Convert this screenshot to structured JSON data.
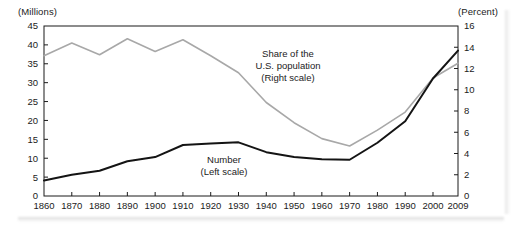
{
  "chart_data": {
    "type": "line",
    "title": "",
    "subtitle": "",
    "xlabel": "",
    "ylabel": "(Millions)",
    "y2label": "(Percent)",
    "left_axis_unit_label": "(Millions)",
    "right_axis_unit_label": "(Percent)",
    "x": [
      1860,
      1870,
      1880,
      1890,
      1900,
      1910,
      1920,
      1930,
      1940,
      1950,
      1960,
      1970,
      1980,
      1990,
      2000,
      2009
    ],
    "xtick_labels": [
      "1860",
      "1870",
      "1880",
      "1890",
      "1900",
      "1910",
      "1920",
      "1930",
      "1940",
      "1950",
      "1960",
      "1970",
      "1980",
      "1990",
      "2000",
      "2009"
    ],
    "xlim": [
      1860,
      2009
    ],
    "ylim": [
      0,
      45
    ],
    "y2lim": [
      0,
      16
    ],
    "ytick_labels": [
      "0",
      "5",
      "10",
      "15",
      "20",
      "25",
      "30",
      "35",
      "40",
      "45"
    ],
    "ytick_values": [
      0,
      5,
      10,
      15,
      20,
      25,
      30,
      35,
      40,
      45
    ],
    "y2tick_labels": [
      "0",
      "2",
      "4",
      "6",
      "8",
      "10",
      "12",
      "14",
      "16"
    ],
    "y2tick_values": [
      0,
      2,
      4,
      6,
      8,
      10,
      12,
      14,
      16
    ],
    "grid": false,
    "legend_position": "inline-annotations",
    "series": [
      {
        "name": "Number (Left scale)",
        "axis": "left",
        "color": "#141414",
        "line_width": 2.0,
        "annotation_line1": "Number",
        "annotation_line2": "(Left scale)",
        "values": [
          4.1,
          5.6,
          6.7,
          9.2,
          10.3,
          13.5,
          13.9,
          14.2,
          11.6,
          10.3,
          9.7,
          9.6,
          14.1,
          19.8,
          31.1,
          38.5
        ]
      },
      {
        "name": "Share of the U.S. population (Right scale)",
        "axis": "right",
        "color": "#a8a8a8",
        "line_width": 1.6,
        "annotation_line1": "Share of the",
        "annotation_line2": "U.S. population",
        "annotation_line3": "(Right scale)",
        "values": [
          13.2,
          14.4,
          13.3,
          14.8,
          13.6,
          14.7,
          13.2,
          11.6,
          8.8,
          6.9,
          5.4,
          4.7,
          6.2,
          7.9,
          11.1,
          12.5
        ]
      }
    ],
    "annotations": [
      {
        "id": "share-annotation",
        "lines": [
          "Share of the",
          "U.S. population",
          "(Right scale)"
        ]
      },
      {
        "id": "number-annotation",
        "lines": [
          "Number",
          "(Left scale)"
        ]
      }
    ]
  }
}
